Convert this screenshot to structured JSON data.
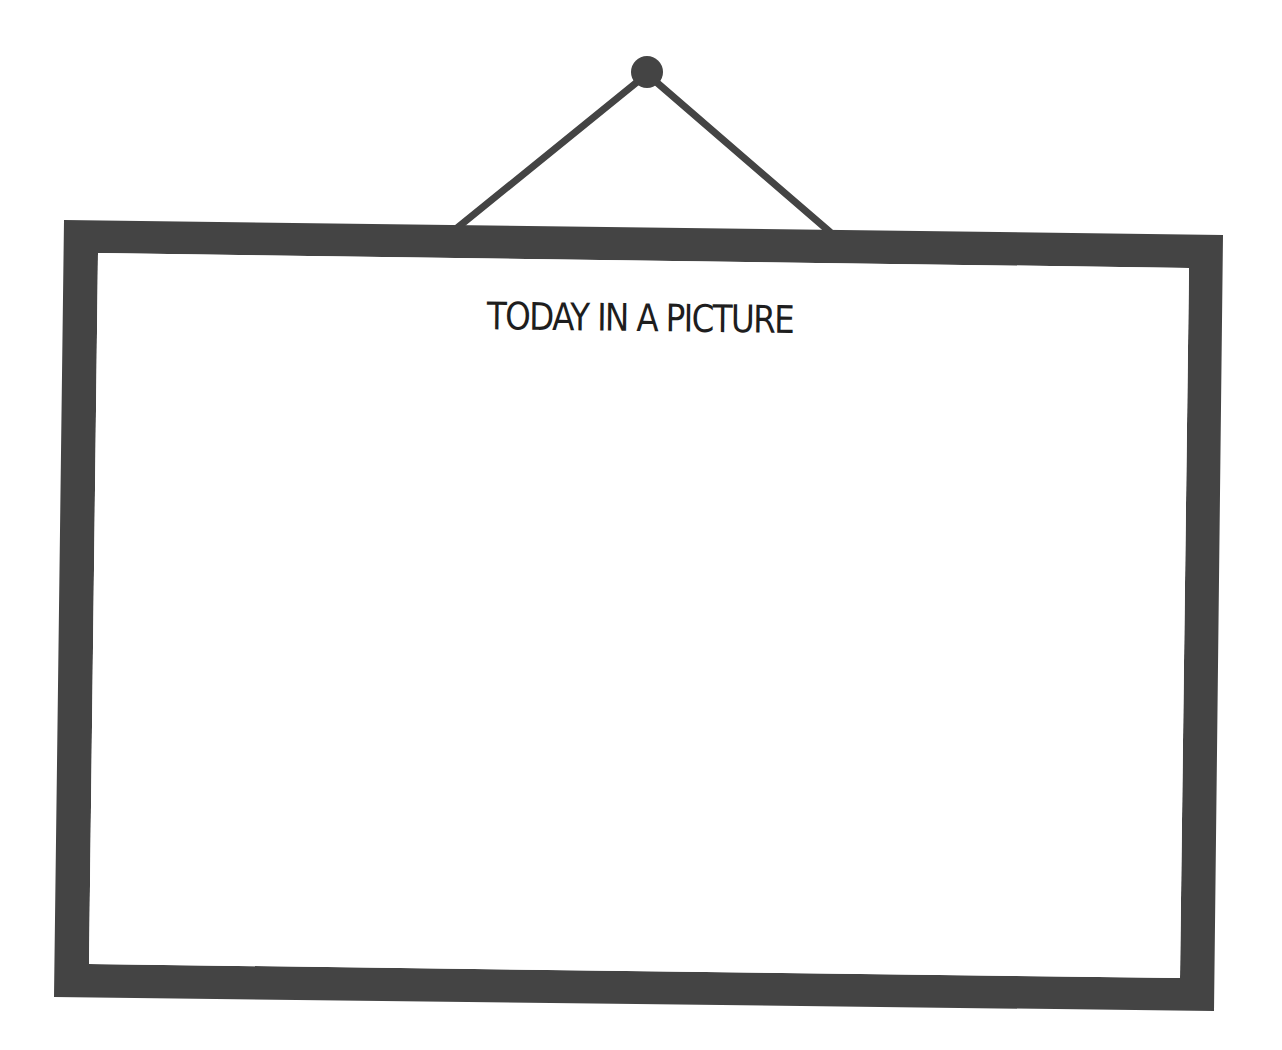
{
  "frame": {
    "title": "TODAY IN A PICTURE",
    "colors": {
      "frame": "#444444",
      "string": "#444444",
      "nail": "#444444",
      "background": "#ffffff",
      "title_text": "#1e1e1e"
    }
  },
  "picture": {
    "content": ""
  }
}
